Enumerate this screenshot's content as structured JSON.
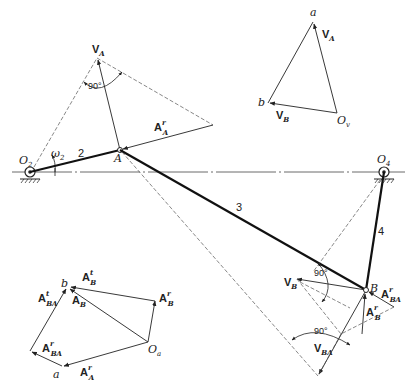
{
  "diagram": {
    "type": "four-bar linkage velocity and acceleration analysis",
    "links": [
      {
        "id": "2",
        "label": "2",
        "from": "O2",
        "to": "A"
      },
      {
        "id": "3",
        "label": "3",
        "from": "A",
        "to": "B"
      },
      {
        "id": "4",
        "label": "4",
        "from": "O4",
        "to": "B"
      }
    ],
    "points": {
      "O2": {
        "label": "O",
        "sub": "2"
      },
      "O4": {
        "label": "O",
        "sub": "4"
      },
      "A": {
        "label": "A"
      },
      "B": {
        "label": "B"
      }
    },
    "omega": {
      "label": "ω",
      "sub": "2"
    },
    "mechanism_vectors": {
      "VA": {
        "main": "V",
        "sub": "A"
      },
      "ArA": {
        "main": "A",
        "sup": "r",
        "sub": "A"
      },
      "VB": {
        "main": "V",
        "sub": "B"
      },
      "ArBA": {
        "main": "A",
        "sup": "r",
        "sub": "BA"
      },
      "ArB": {
        "main": "A",
        "sup": "r",
        "sub": "B"
      },
      "VBA": {
        "main": "V",
        "sub": "BA"
      }
    },
    "angles": [
      "90°",
      "90°",
      "90°"
    ],
    "velocity_polygon": {
      "origin": {
        "label": "O",
        "sub": "v"
      },
      "point_a": "a",
      "point_b": "b",
      "VA": {
        "main": "V",
        "sub": "A"
      },
      "VB": {
        "main": "V",
        "sub": "B"
      }
    },
    "acceleration_polygon": {
      "origin": {
        "label": "O",
        "sub": "a"
      },
      "point_a": "a",
      "point_b": "b",
      "AtB": {
        "main": "A",
        "sup": "t",
        "sub": "B"
      },
      "AtBA": {
        "main": "A",
        "sup": "t",
        "sub": "BA"
      },
      "AB": {
        "main": "A",
        "sub": "B"
      },
      "ArB": {
        "main": "A",
        "sup": "r",
        "sub": "B"
      },
      "ArBA": {
        "main": "A",
        "sup": "r",
        "sub": "BA"
      },
      "ArA": {
        "main": "A",
        "sup": "r",
        "sub": "A"
      }
    }
  }
}
